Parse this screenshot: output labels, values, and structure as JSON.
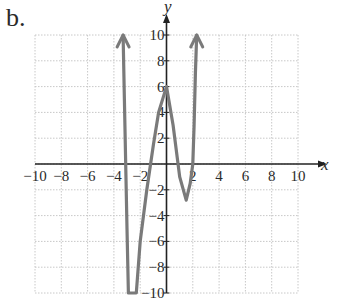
{
  "figure_label": "b.",
  "chart_data": {
    "type": "line",
    "title": "",
    "xlabel": "x",
    "ylabel": "y",
    "xlim": [
      -10,
      10
    ],
    "ylim": [
      -10,
      10
    ],
    "grid": true,
    "x_ticks": [
      -10,
      -8,
      -6,
      -4,
      -2,
      2,
      4,
      6,
      8,
      10
    ],
    "x_tick_labels": [
      "−10",
      "−8",
      "−6",
      "−4",
      "−2",
      "2",
      "4",
      "6",
      "8",
      "10"
    ],
    "y_ticks": [
      10,
      8,
      6,
      4,
      2,
      -2,
      -4,
      -6,
      -8,
      -10
    ],
    "y_tick_labels": [
      "10",
      "8",
      "6",
      "4",
      "2",
      "−2",
      "−4",
      "−6",
      "−8",
      "−10"
    ],
    "series": [
      {
        "name": "f(x)",
        "color": "#7a7a7a",
        "arrows": "both ends pointing up",
        "points": [
          [
            -3.3,
            10
          ],
          [
            -3.2,
            5
          ],
          [
            -3.1,
            0
          ],
          [
            -3.0,
            -5
          ],
          [
            -2.9,
            -10
          ],
          [
            -2.3,
            -10
          ],
          [
            -2.0,
            -6
          ],
          [
            -1.5,
            -2
          ],
          [
            -1.0,
            1.5
          ],
          [
            -0.6,
            4
          ],
          [
            0,
            6
          ],
          [
            0.5,
            3
          ],
          [
            1.0,
            -1
          ],
          [
            1.5,
            -2.8
          ],
          [
            1.8,
            -1.5
          ],
          [
            2.0,
            0
          ],
          [
            2.1,
            3
          ],
          [
            2.2,
            7
          ],
          [
            2.3,
            10
          ]
        ]
      }
    ]
  }
}
